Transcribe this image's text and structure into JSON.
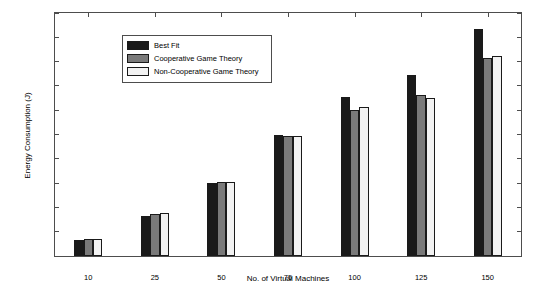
{
  "chart_data": {
    "type": "bar",
    "title": "",
    "xlabel": "No. of Virtual Machines",
    "ylabel": "Energy Consumption (J)",
    "categories": [
      "10",
      "25",
      "50",
      "75",
      "100",
      "125",
      "150"
    ],
    "ylim": [
      0,
      5000
    ],
    "yticks": [
      "0",
      "500",
      "1000",
      "1500",
      "2000",
      "2500",
      "3000",
      "3500",
      "4000",
      "4500",
      "5000"
    ],
    "grid": false,
    "legend_position": "upper left",
    "series": [
      {
        "name": "Best Fit",
        "color": "#1a1a1a",
        "values": [
          330,
          820,
          1510,
          2490,
          3270,
          3730,
          4680
        ]
      },
      {
        "name": "Cooperative Game Theory",
        "color": "#7a7a7a",
        "values": [
          350,
          870,
          1520,
          2470,
          3010,
          3310,
          4080
        ]
      },
      {
        "name": "Non-Cooperative Game Theory",
        "color": "#f2f2f2",
        "values": [
          360,
          880,
          1530,
          2460,
          3060,
          3250,
          4110
        ]
      }
    ]
  }
}
